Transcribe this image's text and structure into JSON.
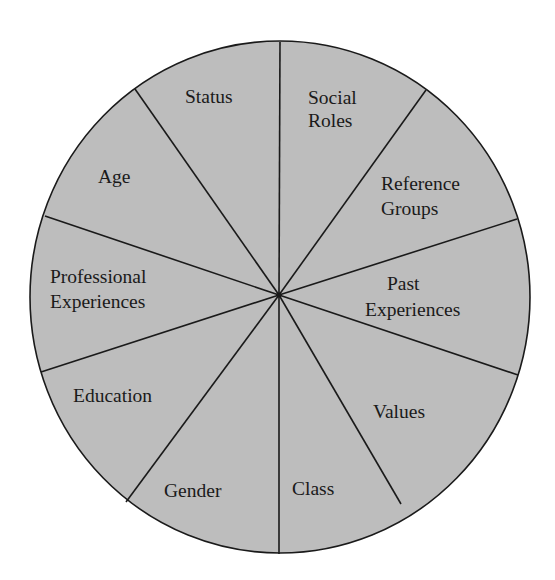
{
  "diagram": {
    "type": "segmented-wheel",
    "center": [
      280,
      297
    ],
    "radius_x": 250,
    "radius_y": 256,
    "fill_color": "#bdbdbd",
    "line_color": "#1a1a1a",
    "background": "#ffffff",
    "segments": [
      {
        "label_lines": [
          "Status"
        ]
      },
      {
        "label_lines": [
          "Social",
          "Roles"
        ]
      },
      {
        "label_lines": [
          "Reference",
          "Groups"
        ]
      },
      {
        "label_lines": [
          "Past",
          "Experiences"
        ]
      },
      {
        "label_lines": [
          "Values"
        ]
      },
      {
        "label_lines": [
          "Class"
        ]
      },
      {
        "label_lines": [
          "Gender"
        ]
      },
      {
        "label_lines": [
          "Education"
        ]
      },
      {
        "label_lines": [
          "Professional",
          "Experiences"
        ]
      },
      {
        "label_lines": [
          "Age"
        ]
      }
    ]
  }
}
